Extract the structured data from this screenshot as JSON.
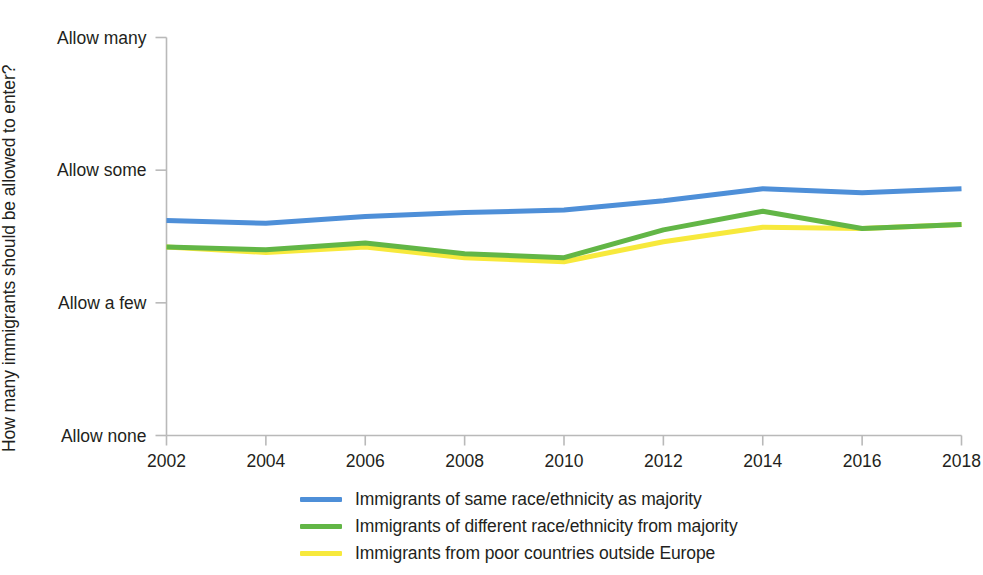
{
  "chart_data": {
    "type": "line",
    "title": "",
    "xlabel": "",
    "ylabel": "How many immigrants should be allowed to enter?",
    "x": [
      2002,
      2004,
      2006,
      2008,
      2010,
      2012,
      2014,
      2016,
      2018
    ],
    "xtick_labels": [
      "2002",
      "2004",
      "2006",
      "2008",
      "2010",
      "2012",
      "2014",
      "2016",
      "2018"
    ],
    "ytick_labels": [
      "Allow many",
      "Allow some",
      "Allow a few",
      "Allow none"
    ],
    "ytick_values": [
      4,
      3,
      2,
      1
    ],
    "ylim": [
      1,
      4
    ],
    "xlim": [
      2002,
      2018
    ],
    "grid": false,
    "legend_position": "bottom",
    "series": [
      {
        "name": "Immigrants of same race/ethnicity as majority",
        "color": "#4e8fd8",
        "values": [
          2.62,
          2.6,
          2.65,
          2.68,
          2.7,
          2.77,
          2.86,
          2.83,
          2.86
        ]
      },
      {
        "name": "Immigrants of different race/ethnicity from majority",
        "color": "#62b646",
        "values": [
          2.42,
          2.4,
          2.45,
          2.37,
          2.34,
          2.55,
          2.69,
          2.56,
          2.59
        ]
      },
      {
        "name": "Immigrants from poor countries outside Europe",
        "color": "#f7e93c",
        "values": [
          2.42,
          2.38,
          2.42,
          2.34,
          2.31,
          2.46,
          2.57,
          2.56,
          2.59
        ]
      }
    ]
  },
  "legend": {
    "items": [
      {
        "label": "Immigrants of same race/ethnicity as majority",
        "color": "#4e8fd8"
      },
      {
        "label": "Immigrants of different race/ethnicity from majority",
        "color": "#62b646"
      },
      {
        "label": "Immigrants from poor countries outside Europe",
        "color": "#f7e93c"
      }
    ]
  },
  "axes": {
    "y_title": "How many immigrants should be allowed to enter?",
    "y_labels": [
      "Allow many",
      "Allow some",
      "Allow a few",
      "Allow none"
    ],
    "x_labels": [
      "2002",
      "2004",
      "2006",
      "2008",
      "2010",
      "2012",
      "2014",
      "2016",
      "2018"
    ]
  }
}
